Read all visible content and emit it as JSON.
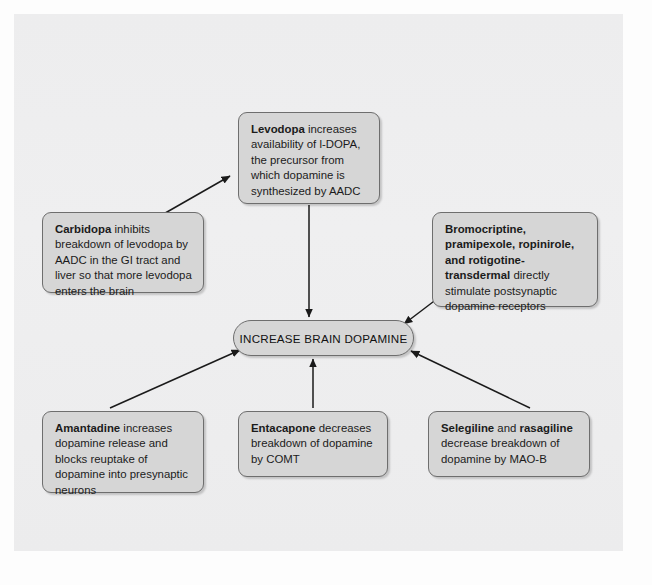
{
  "diagram": {
    "center": {
      "label": "INCREASE BRAIN DOPAMINE"
    },
    "nodes": [
      {
        "id": "levodopa",
        "bold": "Levodopa",
        "rest": " increases availability of l-DOPA, the precursor from which dopamine is synthesized by AADC"
      },
      {
        "id": "carbidopa",
        "bold": "Carbidopa",
        "rest": " inhibits breakdown of levodopa by AADC in the GI tract and liver so that more levodopa enters the brain"
      },
      {
        "id": "dopamine-agonists",
        "bold": "Bromocriptine, pramipexole, ropinirole, and rotigotine-transdermal",
        "rest": " directly stimulate postsynaptic dopamine receptors"
      },
      {
        "id": "amantadine",
        "bold": "Amantadine",
        "rest": " increases dopamine release and blocks reuptake of dopamine into presynaptic neurons"
      },
      {
        "id": "entacapone",
        "bold": "Entacapone",
        "rest": " decreases breakdown of dopamine by COMT"
      },
      {
        "id": "selegiline",
        "bold_1": "Selegiline",
        "mid": " and ",
        "bold_2": "rasagiline",
        "rest": " decrease breakdown of dopamine by MAO-B"
      }
    ],
    "arrows": [
      {
        "from": "carbidopa",
        "to": "levodopa"
      },
      {
        "from": "levodopa",
        "to": "center"
      },
      {
        "from": "dopamine-agonists",
        "to": "center"
      },
      {
        "from": "amantadine",
        "to": "center"
      },
      {
        "from": "entacapone",
        "to": "center"
      },
      {
        "from": "selegiline",
        "to": "center"
      }
    ]
  },
  "colors": {
    "page_background": "#eeeeef",
    "node_fill": "#d6d6d6",
    "node_border": "#6e6e6e",
    "connector": "#1a1a1a",
    "text": "#1b1b1b"
  },
  "ghost_text": {
    "top": "",
    "bottom_left": "",
    "bottom_right": ""
  }
}
